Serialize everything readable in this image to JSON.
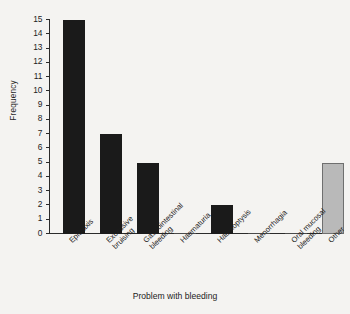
{
  "chart_data": {
    "type": "bar",
    "title": "",
    "xlabel": "Problem with bleeding",
    "ylabel": "Frequency",
    "categories": [
      "Epistaxis",
      "Excessive bruising",
      "Gastrointestinal bleeding",
      "Haematuria",
      "Haemoptysis",
      "Menorrhagia",
      "Oral mucosal bleeding",
      "Other"
    ],
    "category_lines": [
      [
        "Epistaxis"
      ],
      [
        "Excessive",
        "bruising"
      ],
      [
        "Gastrointestinal",
        "bleeding"
      ],
      [
        "Haematuria"
      ],
      [
        "Haemoptysis"
      ],
      [
        "Menorrhagia"
      ],
      [
        "Oral mucosal",
        "bleeding"
      ],
      [
        "Other"
      ]
    ],
    "values": [
      15,
      7,
      5,
      0,
      2,
      0,
      0,
      5
    ],
    "ylim": [
      0,
      15
    ],
    "yticks": [
      0,
      1,
      2,
      3,
      4,
      5,
      6,
      7,
      8,
      9,
      10,
      11,
      12,
      13,
      14,
      15
    ],
    "ytick_labels": [
      "0",
      "1",
      "2",
      "3",
      "4",
      "5",
      "6",
      "7",
      "8",
      "9",
      "10",
      "11",
      "12",
      "13",
      "14",
      "15"
    ],
    "grid": false,
    "legend": "none",
    "bar_colors": [
      "#1a1a1a",
      "#1a1a1a",
      "#1a1a1a",
      "#1a1a1a",
      "#1a1a1a",
      "#1a1a1a",
      "#1a1a1a",
      "#b9b9b9"
    ],
    "accent_dark": "#1a1a1a",
    "accent_light": "#b9b9b9",
    "background": "#f4f3f1",
    "axis_color": "#2b2b2b"
  }
}
